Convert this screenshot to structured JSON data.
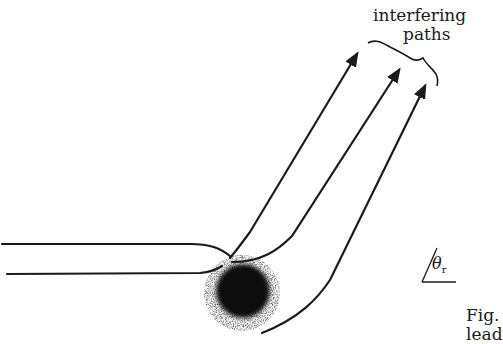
{
  "figure": {
    "labels": {
      "interfering": "interfering",
      "paths": "paths",
      "theta_symbol": "θ",
      "theta_subscript": "r",
      "caption_fig": "Fig.",
      "caption_cut": "lead"
    },
    "colors": {
      "ink": "#1a1a1a",
      "background": "#ffffff"
    },
    "elements": {
      "incoming_paths": 2,
      "outgoing_paths": 3,
      "scatterer": "dark blurred disk",
      "brace": "curly brace grouping arrow tips",
      "angle_marker": "θr angle to horizontal"
    }
  }
}
